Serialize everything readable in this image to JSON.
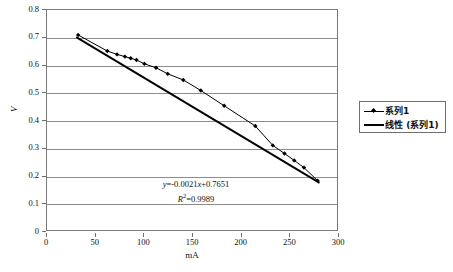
{
  "chart_data": {
    "type": "scatter",
    "title": "",
    "xlabel": "mA",
    "ylabel": "V",
    "xlim": [
      0,
      300
    ],
    "ylim": [
      0,
      0.8
    ],
    "xticks": [
      0,
      50,
      100,
      150,
      200,
      250,
      300
    ],
    "yticks": [
      0,
      0.1,
      0.2,
      0.3,
      0.4,
      0.5,
      0.6,
      0.7,
      0.8
    ],
    "grid": "horizontal",
    "legend_position": "right",
    "series": [
      {
        "name": "系列1",
        "marker": "diamond",
        "color": "#000000",
        "x": [
          32,
          62,
          72,
          80,
          86,
          92,
          100,
          112,
          124,
          140,
          158,
          182,
          214,
          232,
          244,
          254,
          264,
          278
        ],
        "y": [
          0.71,
          0.652,
          0.64,
          0.632,
          0.626,
          0.62,
          0.606,
          0.592,
          0.57,
          0.548,
          0.51,
          0.455,
          0.382,
          0.312,
          0.283,
          0.258,
          0.232,
          0.185
        ]
      },
      {
        "name": "线性 (系列1)",
        "type": "trendline",
        "color": "#000000",
        "slope": -0.0021,
        "intercept": 0.7651,
        "r_squared": 0.9989
      }
    ],
    "annotations": {
      "equation": "y=-0.0021x+0.7651",
      "equation_y": "y",
      "equation_rest": "=-0.0021",
      "equation_x": "x",
      "equation_tail": "+0.7651",
      "r2_symbol": "R",
      "r2_value": "=0.9989"
    }
  },
  "axes": {
    "y_title": "V",
    "x_title": "mA",
    "y_tick_labels": [
      "0.8",
      "0.7",
      "0.6",
      "0.5",
      "0.4",
      "0.3",
      "0.2",
      "0.1",
      "0"
    ],
    "x_tick_labels": [
      "0",
      "50",
      "100",
      "150",
      "200",
      "250",
      "300"
    ]
  },
  "legend": {
    "items": [
      {
        "label": "系列1",
        "key": "marker-line"
      },
      {
        "label": "线性 (系列1)",
        "key": "line"
      }
    ]
  }
}
